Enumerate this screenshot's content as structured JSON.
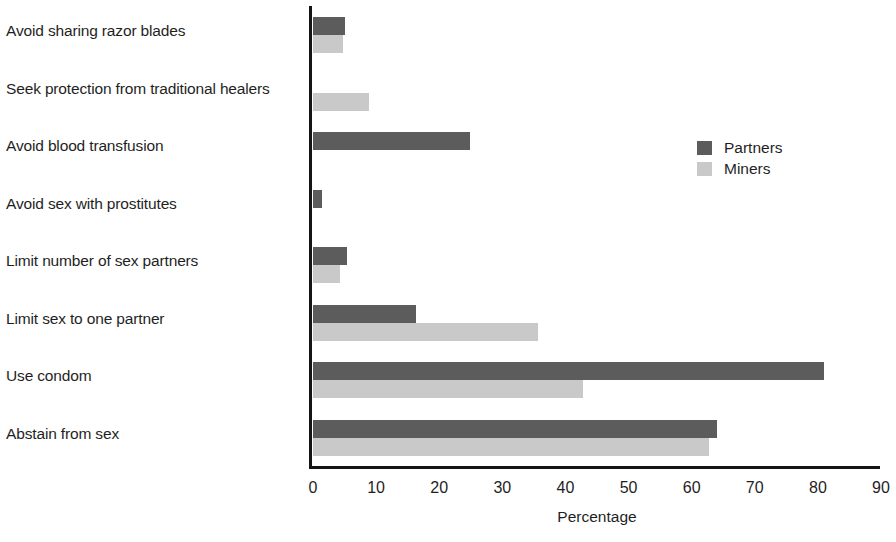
{
  "chart_data": {
    "type": "bar",
    "orientation": "horizontal",
    "title": "",
    "xlabel": "Percentage",
    "ylabel": "",
    "xlim": [
      0,
      90
    ],
    "xticks": [
      0,
      10,
      20,
      30,
      40,
      50,
      60,
      70,
      80,
      90
    ],
    "grid": false,
    "legend_position": "right-upper",
    "categories": [
      "Avoid sharing razor blades",
      "Seek protection from traditional healers",
      "Avoid blood transfusion",
      "Avoid sex with prostitutes",
      "Limit number of sex partners",
      "Limit sex to one partner",
      "Use condom",
      "Abstain from sex"
    ],
    "series": [
      {
        "name": "Partners",
        "color": "#5c5c5c",
        "values": [
          5.1,
          0,
          24.8,
          1.5,
          5.4,
          16.3,
          80.9,
          64.0
        ]
      },
      {
        "name": "Miners",
        "color": "#c9c9c9",
        "values": [
          4.8,
          8.8,
          0,
          0,
          4.3,
          35.6,
          42.8,
          62.8
        ]
      }
    ]
  },
  "legend": {
    "items": [
      {
        "label": "Partners",
        "swatch": "partners"
      },
      {
        "label": "Miners",
        "swatch": "miners"
      }
    ]
  }
}
